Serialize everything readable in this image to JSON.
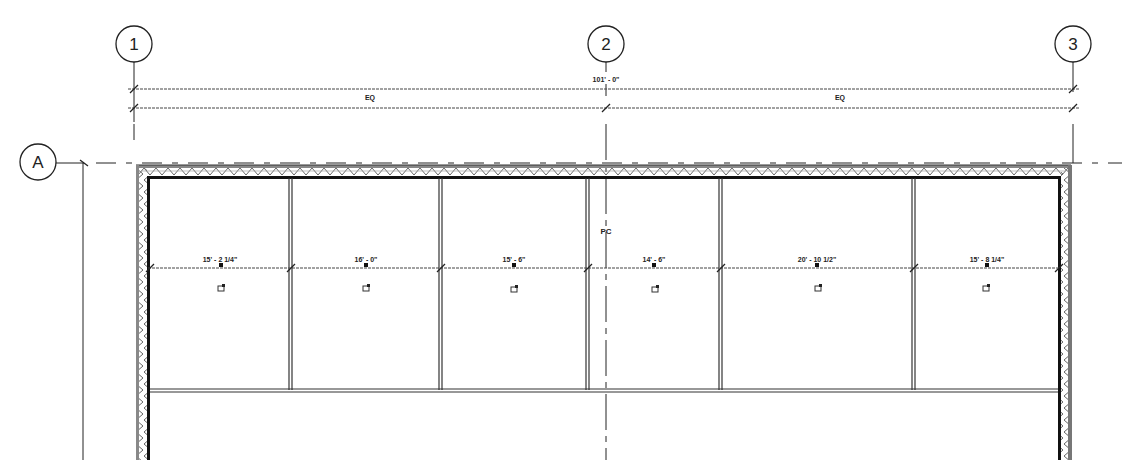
{
  "grid": {
    "vertical": [
      {
        "label": "1",
        "x": 134
      },
      {
        "label": "2",
        "x": 606
      },
      {
        "label": "3",
        "x": 1073
      }
    ],
    "horizontal": [
      {
        "label": "A",
        "y": 163
      }
    ]
  },
  "dimensions": {
    "overall": "101' - 0\"",
    "eq_left": "EQ",
    "eq_right": "EQ",
    "bays": [
      {
        "label": "15' - 2 1/4\"",
        "x1": 150,
        "x2": 290
      },
      {
        "label": "16' - 0\"",
        "x1": 290,
        "x2": 440
      },
      {
        "label": "15' - 6\"",
        "x1": 440,
        "x2": 587
      },
      {
        "label": "14' - 6\"",
        "x1": 587,
        "x2": 720
      },
      {
        "label": "20' - 10 1/2\"",
        "x1": 720,
        "x2": 913
      },
      {
        "label": "15' - 8 1/4\"",
        "x1": 913,
        "x2": 1060
      }
    ]
  },
  "annotations": {
    "centerline_tag": "PC"
  },
  "colors": {
    "line": "#222222",
    "hatch": "#777777",
    "background": "#ffffff"
  }
}
